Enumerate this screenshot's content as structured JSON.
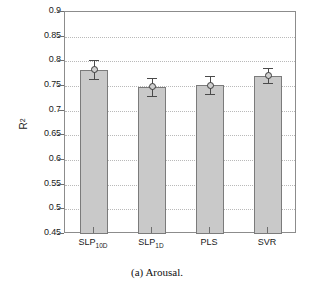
{
  "caption": "(a) Arousal.",
  "chart_data": {
    "type": "bar",
    "title": "",
    "xlabel": "",
    "ylabel": "R2",
    "ylabel_display": "R",
    "ylabel_exponent": "2",
    "categories": [
      "SLP10D",
      "SLP1D",
      "PLS",
      "SVR"
    ],
    "category_labels": [
      {
        "base": "SLP",
        "sub": "10D"
      },
      {
        "base": "SLP",
        "sub": "1D"
      },
      {
        "base": "PLS",
        "sub": ""
      },
      {
        "base": "SVR",
        "sub": ""
      }
    ],
    "values": [
      0.783,
      0.748,
      0.752,
      0.771
    ],
    "errors": [
      0.019,
      0.019,
      0.019,
      0.0145
    ],
    "ylim": [
      0.45,
      0.9
    ],
    "ytick_values": [
      0.9,
      0.85,
      0.8,
      0.75,
      0.7,
      0.65,
      0.6,
      0.55,
      0.5,
      0.45
    ],
    "ytick_labels": [
      "0.9",
      "0.85",
      "0.8",
      "0.75",
      "0.7",
      "0.65",
      "0.6",
      "0.55",
      "0.5",
      "0.45"
    ],
    "grid": true,
    "grid_axis": "y",
    "legend": null,
    "bar_fill_color": "#c9c9c9",
    "bar_edge_color": "#7b7b7b",
    "error_color": "#4a4a4a",
    "grid_color": "#b9b9b9",
    "axis_color": "#8c8c8c"
  }
}
